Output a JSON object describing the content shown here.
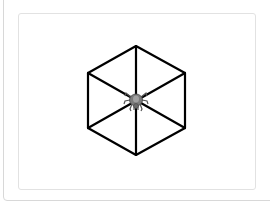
{
  "game": {
    "board_shape": "hexagon-web",
    "line_color": "#000000",
    "piece": {
      "type": "spider",
      "icon": "spider-icon",
      "color": "#808080"
    }
  }
}
